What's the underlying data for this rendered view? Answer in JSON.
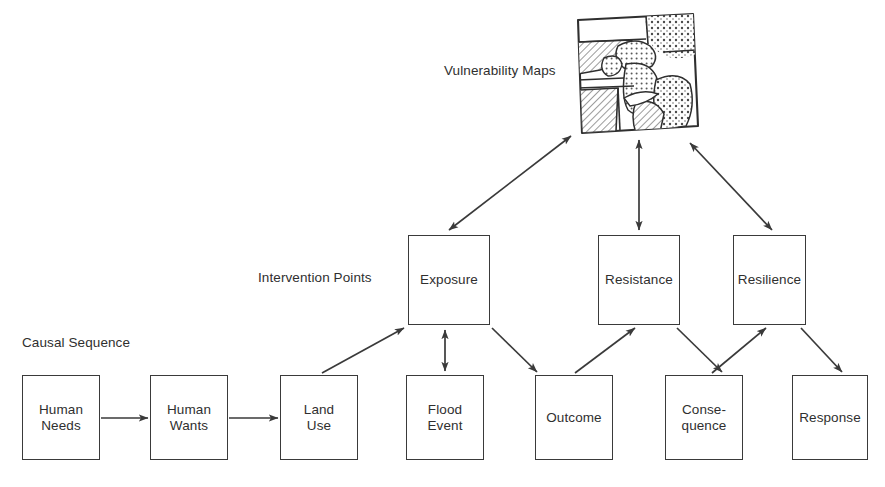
{
  "figure": {
    "background_color": "#ffffff",
    "line_color": "#3a3a3a",
    "text_color": "#2f2f2f"
  },
  "row_labels": {
    "intervention_points": "Intervention Points",
    "causal_sequence": "Causal Sequence"
  },
  "map": {
    "caption": "Vulnerability Maps",
    "icon_name": "vulnerability-map-thumbnail",
    "description": "Hand drawn tilted square map subdivided into regions with diagonal hatching and stippled dot fills"
  },
  "intervention_nodes": [
    {
      "id": "exposure",
      "label": "Exposure",
      "x": 408,
      "y": 235,
      "w": 82,
      "h": 90
    },
    {
      "id": "resistance",
      "label": "Resistance",
      "x": 598,
      "y": 235,
      "w": 82,
      "h": 90
    },
    {
      "id": "resilience",
      "label": "Resilience",
      "x": 733,
      "y": 235,
      "w": 73,
      "h": 90
    }
  ],
  "causal_nodes": [
    {
      "id": "human-needs",
      "label": "Human\nNeeds",
      "x": 22,
      "y": 375,
      "w": 78,
      "h": 85
    },
    {
      "id": "human-wants",
      "label": "Human\nWants",
      "x": 150,
      "y": 375,
      "w": 78,
      "h": 85
    },
    {
      "id": "land-use",
      "label": "Land\nUse",
      "x": 280,
      "y": 375,
      "w": 78,
      "h": 85
    },
    {
      "id": "flood-event",
      "label": "Flood\nEvent",
      "x": 406,
      "y": 375,
      "w": 78,
      "h": 85
    },
    {
      "id": "outcome",
      "label": "Outcome",
      "x": 535,
      "y": 375,
      "w": 78,
      "h": 85
    },
    {
      "id": "consequence",
      "label": "Conse-\nquence",
      "x": 665,
      "y": 375,
      "w": 78,
      "h": 85
    },
    {
      "id": "response",
      "label": "Response",
      "x": 792,
      "y": 375,
      "w": 76,
      "h": 85
    }
  ],
  "connections": [
    {
      "id": "human-needs-to-human-wants",
      "from": "Human Needs",
      "to": "Human Wants",
      "style": "single-arrow"
    },
    {
      "id": "human-wants-to-land-use",
      "from": "Human Wants",
      "to": "Land Use",
      "style": "single-arrow"
    },
    {
      "id": "land-use-to-exposure",
      "from": "Land Use",
      "to": "Exposure",
      "style": "single-arrow"
    },
    {
      "id": "exposure-to-flood-event",
      "from": "Exposure",
      "to": "Flood Event",
      "style": "double-arrow"
    },
    {
      "id": "exposure-to-outcome",
      "from": "Exposure",
      "to": "Outcome",
      "style": "single-arrow"
    },
    {
      "id": "outcome-to-resistance",
      "from": "Outcome",
      "to": "Resistance",
      "style": "single-arrow"
    },
    {
      "id": "resistance-to-consequence",
      "from": "Resistance",
      "to": "Consequence",
      "style": "single-arrow"
    },
    {
      "id": "consequence-to-resilience",
      "from": "Consequence",
      "to": "Resilience",
      "style": "single-arrow"
    },
    {
      "id": "resilience-to-response",
      "from": "Resilience",
      "to": "Response",
      "style": "single-arrow"
    },
    {
      "id": "exposure-to-map",
      "from": "Exposure",
      "to": "Vulnerability Maps",
      "style": "double-arrow"
    },
    {
      "id": "resistance-to-map",
      "from": "Resistance",
      "to": "Vulnerability Maps",
      "style": "double-arrow"
    },
    {
      "id": "resilience-to-map",
      "from": "Resilience",
      "to": "Vulnerability Maps",
      "style": "double-arrow"
    }
  ]
}
